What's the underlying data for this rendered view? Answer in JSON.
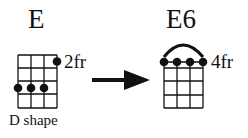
{
  "chord_from": {
    "name": "E",
    "fret_label": "2fr",
    "shape_label": "D shape"
  },
  "chord_to": {
    "name": "E6",
    "fret_label": "4fr"
  },
  "arrow": "right-arrow"
}
